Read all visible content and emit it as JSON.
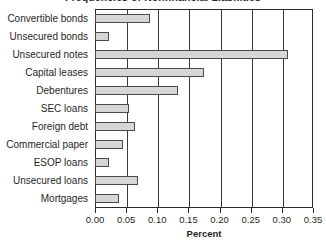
{
  "chart_data": {
    "type": "bar",
    "orientation": "horizontal",
    "title": "Frequencies of Nonfinancial Liabilities",
    "xlabel": "Percent",
    "ylabel": "",
    "xlim": [
      0.0,
      0.35
    ],
    "xticks": [
      "0.00",
      "0.05",
      "0.10",
      "0.15",
      "0.20",
      "0.25",
      "0.30",
      "0.35"
    ],
    "xtick_values": [
      0.0,
      0.05,
      0.1,
      0.15,
      0.2,
      0.25,
      0.3,
      0.35
    ],
    "grid": "vertical",
    "legend": "none",
    "bar_fill": "#d6d6d6",
    "bar_edge": "#4a4a4a",
    "categories": [
      "Convertible bonds",
      "Unsecured bonds",
      "Unsecured notes",
      "Capital leases",
      "Debentures",
      "SEC loans",
      "Foreign debt",
      "Commercial paper",
      "ESOP loans",
      "Unsecured loans",
      "Mortgages"
    ],
    "values": [
      0.089,
      0.022,
      0.31,
      0.175,
      0.133,
      0.055,
      0.064,
      0.045,
      0.022,
      0.069,
      0.038
    ]
  }
}
